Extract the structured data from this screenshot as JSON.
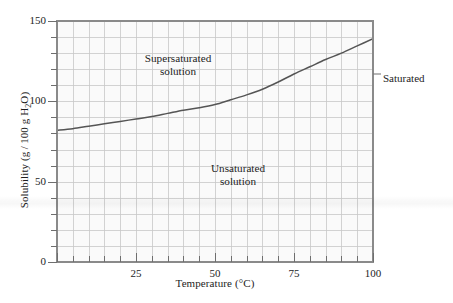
{
  "figure": {
    "background_color": "#ffffff",
    "plot_background_color": "#fafafa",
    "axis_color": "#8a8a8a",
    "grid_color": "#c8c8c8",
    "curve_color": "#555555",
    "text_color": "#1d1d1d"
  },
  "chart_data": {
    "type": "line",
    "title": "",
    "subtitle": "",
    "xlabel_prefix": "Temperature (",
    "xlabel_unit": "°C",
    "xlabel_suffix": ")",
    "xlabel": "Temperature (°C)",
    "ylabel_prefix": "Solubility (g / 100 g H",
    "ylabel_sub": "2",
    "ylabel_suffix": "O)",
    "ylabel": "Solubility (g/100 g H2O)",
    "xlim": [
      0,
      100
    ],
    "ylim": [
      0,
      150
    ],
    "x_major_ticks": [
      0,
      25,
      50,
      75,
      100
    ],
    "x_major_tick_labels": [
      "0",
      "25",
      "50",
      "75",
      "100"
    ],
    "x_labeled_ticks": [
      25,
      50,
      75,
      100
    ],
    "x_labeled_tick_labels": [
      "25",
      "50",
      "75",
      "100"
    ],
    "x_minor_tick_step": 5,
    "y_major_ticks": [
      0,
      50,
      100,
      150
    ],
    "y_major_tick_labels": [
      "0",
      "50",
      "100",
      "150"
    ],
    "y_minor_tick_step": 10,
    "grid": true,
    "grid_x_step": 5,
    "grid_y_step": 10,
    "legend_position": "none",
    "series": [
      {
        "name": "Saturated",
        "x": [
          0,
          5,
          10,
          15,
          20,
          25,
          30,
          35,
          40,
          45,
          50,
          55,
          60,
          65,
          70,
          75,
          80,
          85,
          90,
          95,
          100
        ],
        "values": [
          82,
          83,
          84.5,
          86,
          87.5,
          89,
          90.5,
          92.5,
          94.5,
          96,
          98,
          101,
          104,
          107.5,
          112,
          117,
          121.5,
          126,
          130,
          134.5,
          139
        ]
      }
    ],
    "annotations": [
      {
        "name": "saturated",
        "text": "Saturated",
        "x": 100,
        "y": 117,
        "leader_line": true
      },
      {
        "name": "supersaturated-region",
        "line1": "Supersaturated",
        "line2": "solution"
      },
      {
        "name": "unsaturated-region",
        "line1": "Unsaturated",
        "line2": "solution"
      }
    ]
  },
  "labels": {
    "supersaturated_line1": "Supersaturated",
    "supersaturated_line2": "solution",
    "unsaturated_line1": "Unsaturated",
    "unsaturated_line2": "solution",
    "saturated": "Saturated"
  }
}
